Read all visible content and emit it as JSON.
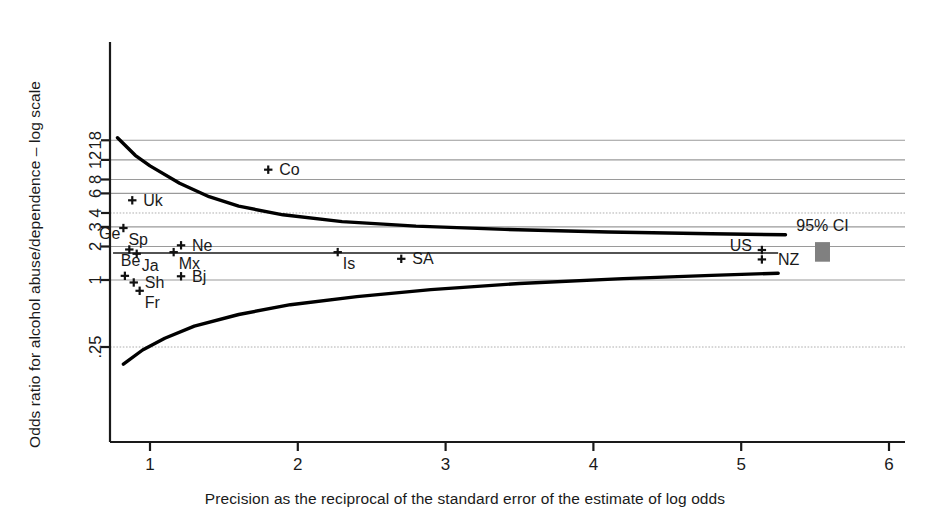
{
  "chart_data": {
    "type": "scatter",
    "title": "",
    "subtitle": "",
    "xlabel": "Precision as the reciprocal of the standard error of the estimate of log odds",
    "ylabel": "Odds ratio for alcohol abuse/dependence – log scale",
    "x_scale": "linear",
    "y_scale": "log",
    "xlim": [
      0.55,
      6.05
    ],
    "ylim": [
      0.16,
      22.0
    ],
    "xticks": [
      1,
      2,
      3,
      4,
      5,
      6
    ],
    "xticklabels": [
      "1",
      "2",
      "3",
      "4",
      "5",
      "6"
    ],
    "yticks": [
      0.25,
      1,
      2,
      3,
      4,
      6,
      8,
      12,
      18
    ],
    "yticklabels": [
      ".25",
      "1",
      "2",
      "3",
      "4",
      "6",
      "8",
      "12",
      "18"
    ],
    "grid": "horizontal",
    "grid_color": "#9a9a9a",
    "legend": "none",
    "pooled_line": {
      "label": "",
      "y": 1.75,
      "x_start": 0.75,
      "x_end": 5.25
    },
    "funnel_curves": {
      "description": "95% confidence funnel around pooled odds ratio",
      "upper": [
        {
          "x": 0.78,
          "y": 19.0
        },
        {
          "x": 0.9,
          "y": 13.2
        },
        {
          "x": 1.0,
          "y": 10.6
        },
        {
          "x": 1.2,
          "y": 7.4
        },
        {
          "x": 1.4,
          "y": 5.6
        },
        {
          "x": 1.6,
          "y": 4.6
        },
        {
          "x": 1.9,
          "y": 3.85
        },
        {
          "x": 2.3,
          "y": 3.35
        },
        {
          "x": 2.8,
          "y": 3.05
        },
        {
          "x": 3.4,
          "y": 2.85
        },
        {
          "x": 4.1,
          "y": 2.7
        },
        {
          "x": 4.8,
          "y": 2.6
        },
        {
          "x": 5.3,
          "y": 2.55
        }
      ],
      "lower": [
        {
          "x": 0.82,
          "y": 0.175
        },
        {
          "x": 0.95,
          "y": 0.235
        },
        {
          "x": 1.1,
          "y": 0.3
        },
        {
          "x": 1.3,
          "y": 0.385
        },
        {
          "x": 1.6,
          "y": 0.49
        },
        {
          "x": 1.95,
          "y": 0.6
        },
        {
          "x": 2.4,
          "y": 0.71
        },
        {
          "x": 2.9,
          "y": 0.82
        },
        {
          "x": 3.5,
          "y": 0.93
        },
        {
          "x": 4.2,
          "y": 1.03
        },
        {
          "x": 4.8,
          "y": 1.1
        },
        {
          "x": 5.25,
          "y": 1.15
        }
      ]
    },
    "ci_marker": {
      "label": "95% CI",
      "x": 5.55,
      "y_low": 1.46,
      "y_high": 2.19,
      "color": "#808080"
    },
    "points": [
      {
        "label": "Co",
        "x": 1.8,
        "y": 9.8,
        "label_pos": "right"
      },
      {
        "label": "Uk",
        "x": 0.88,
        "y": 5.2,
        "label_pos": "right"
      },
      {
        "label": "Sp",
        "x": 0.82,
        "y": 2.93,
        "label_pos": "below-right"
      },
      {
        "label": "Ge",
        "x": 0.86,
        "y": 1.88,
        "label_pos": "above-left"
      },
      {
        "label": "Ne",
        "x": 1.21,
        "y": 2.05,
        "label_pos": "right"
      },
      {
        "label": "Ja",
        "x": 0.91,
        "y": 1.72,
        "label_pos": "below-right"
      },
      {
        "label": "Mx",
        "x": 1.16,
        "y": 1.78,
        "label_pos": "below-right"
      },
      {
        "label": "Is",
        "x": 2.27,
        "y": 1.78,
        "label_pos": "below-right"
      },
      {
        "label": "SA",
        "x": 2.7,
        "y": 1.55,
        "label_pos": "right"
      },
      {
        "label": "US",
        "x": 5.14,
        "y": 1.86,
        "label_pos": "left"
      },
      {
        "label": "Be",
        "x": 0.83,
        "y": 1.09,
        "label_pos": "above-right"
      },
      {
        "label": "Bj",
        "x": 1.21,
        "y": 1.08,
        "label_pos": "right"
      },
      {
        "label": "Sh",
        "x": 0.89,
        "y": 0.95,
        "label_pos": "right"
      },
      {
        "label": "Fr",
        "x": 0.93,
        "y": 0.8,
        "label_pos": "below-right"
      },
      {
        "label": "NZ",
        "x": 5.14,
        "y": 1.53,
        "label_pos": "right-far"
      }
    ]
  },
  "axes": {
    "x_title": "Precision as the reciprocal of the standard error of the estimate of log odds",
    "y_title": "Odds ratio for alcohol abuse/dependence – log scale"
  },
  "colors": {
    "axis": "#1a1a1a",
    "grid": "#9a9a9a",
    "marker": "#111111",
    "curve": "#000000",
    "ci_box": "#808080",
    "background": "#ffffff"
  }
}
